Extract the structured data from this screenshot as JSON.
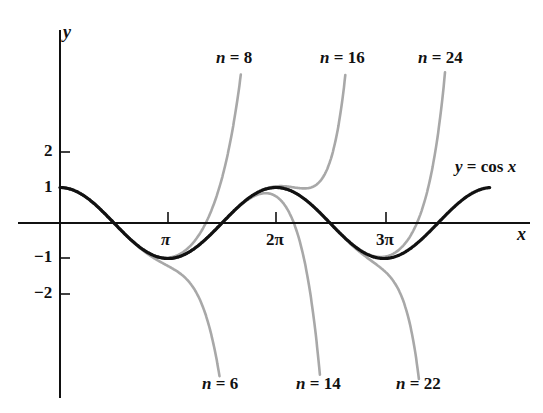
{
  "chart_data": {
    "type": "line",
    "title": "",
    "xlabel": "x",
    "ylabel": "y",
    "xlim": [
      0,
      13.8
    ],
    "ylim": [
      -5,
      4.3
    ],
    "grid": false,
    "x_ticks": [
      {
        "value": 3.14159,
        "label": "π"
      },
      {
        "value": 6.28318,
        "label": "2π"
      },
      {
        "value": 9.42478,
        "label": "3π"
      }
    ],
    "y_ticks": [
      {
        "value": 2,
        "label": "2"
      },
      {
        "value": 1,
        "label": "1"
      },
      {
        "value": -1,
        "label": "−1"
      },
      {
        "value": -2,
        "label": "−2"
      }
    ],
    "series": [
      {
        "name": "y = cos x",
        "function": "cos",
        "x_range": [
          0,
          12.5
        ],
        "color": "#111111",
        "width": 3.2
      },
      {
        "name": "n = 6",
        "degree": 6,
        "x_range": [
          0,
          5.0
        ],
        "color": "#a8a8a8",
        "clip_below": -4.4
      },
      {
        "name": "n = 8",
        "degree": 8,
        "x_range": [
          0,
          5.5
        ],
        "color": "#a8a8a8",
        "clip_above": 4.3
      },
      {
        "name": "n = 14",
        "degree": 14,
        "x_range": [
          0,
          8.2
        ],
        "color": "#a8a8a8",
        "clip_below": -4.4
      },
      {
        "name": "n = 16",
        "degree": 16,
        "x_range": [
          0,
          8.5
        ],
        "color": "#a8a8a8",
        "clip_above": 4.3
      },
      {
        "name": "n = 22",
        "degree": 22,
        "x_range": [
          0,
          11.2
        ],
        "color": "#a8a8a8",
        "clip_below": -4.4
      },
      {
        "name": "n = 24",
        "degree": 24,
        "x_range": [
          0,
          11.5
        ],
        "color": "#a8a8a8",
        "clip_above": 4.3
      }
    ],
    "annotations": [
      {
        "text": "y = cos x",
        "x": 11.8,
        "y": 1.5
      },
      {
        "text": "n = 8",
        "position": "top"
      },
      {
        "text": "n = 16",
        "position": "top"
      },
      {
        "text": "n = 24",
        "position": "top"
      },
      {
        "text": "n = 6",
        "position": "bottom"
      },
      {
        "text": "n = 14",
        "position": "bottom"
      },
      {
        "text": "n = 22",
        "position": "bottom"
      }
    ]
  },
  "labels": {
    "y_axis": "y",
    "x_axis": "x",
    "cos_label_lhs": "y",
    "cos_label_eq": " = cos ",
    "cos_label_rhs": "x",
    "n_var": "n",
    "n8": " = 8",
    "n16": " = 16",
    "n24": " = 24",
    "n6": " = 6",
    "n14": " = 14",
    "n22": " = 22",
    "tick_pi": "π",
    "tick_2pi": "2π",
    "tick_3pi": "3π",
    "tick_2": "2",
    "tick_1": "1",
    "tick_m1": "−1",
    "tick_m2": "−2"
  }
}
